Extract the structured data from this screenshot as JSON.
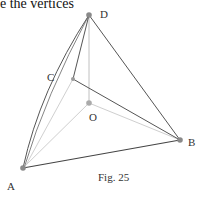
{
  "text": {
    "top_fragment": "e the vertices",
    "figure_caption": "Fig. 25"
  },
  "figure": {
    "vertices": {
      "A": {
        "label": "A",
        "x": 23,
        "y": 168
      },
      "B": {
        "label": "B",
        "x": 180,
        "y": 140
      },
      "C": {
        "label": "C",
        "x": 73,
        "y": 79
      },
      "D": {
        "label": "D",
        "x": 89,
        "y": 15
      },
      "O": {
        "label": "O",
        "x": 89,
        "y": 103
      }
    },
    "colors": {
      "edge_dark": "#555555",
      "edge_light": "#c8c8c8",
      "point": "#8a8a8a"
    }
  }
}
